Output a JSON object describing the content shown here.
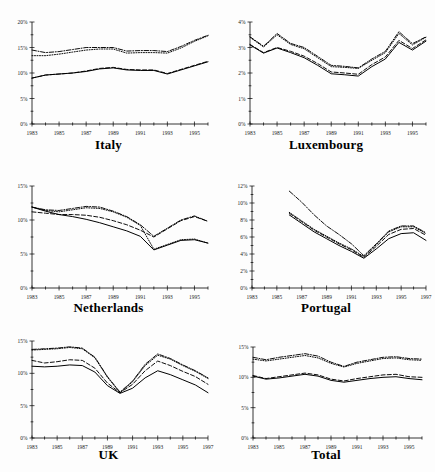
{
  "figure": {
    "layout": "2 columns x 3 rows of small-multiple line charts",
    "background_color": "#ffffff",
    "line_color": "#000000"
  },
  "chart_data": [
    {
      "type": "line",
      "title": "Italy",
      "xlabel": "",
      "ylabel": "",
      "grid": false,
      "legend_position": "none",
      "xlim": [
        1983,
        1996
      ],
      "ylim": [
        0,
        20
      ],
      "x": [
        1983,
        1984,
        1985,
        1986,
        1987,
        1988,
        1989,
        1990,
        1991,
        1992,
        1993,
        1994,
        1995,
        1996
      ],
      "xticklabels": [
        "1983",
        "1985",
        "1987",
        "1989",
        "1991",
        "1993",
        "1995"
      ],
      "xtickvalues": [
        1983,
        1985,
        1987,
        1989,
        1991,
        1993,
        1995
      ],
      "yticklabels": [
        "0%",
        "5%",
        "10%",
        "15%",
        "20%"
      ],
      "ytickvalues": [
        0,
        5,
        10,
        15,
        20
      ],
      "series": [
        {
          "name": "series-1",
          "style": "solid",
          "values": [
            9.0,
            9.6,
            9.8,
            10.0,
            10.3,
            10.8,
            11.0,
            10.6,
            10.5,
            10.5,
            9.8,
            10.6,
            11.4,
            12.2
          ]
        },
        {
          "name": "series-2",
          "style": "dashed",
          "values": [
            9.0,
            9.6,
            9.8,
            10.0,
            10.4,
            10.9,
            11.1,
            10.7,
            10.6,
            10.6,
            9.9,
            10.7,
            11.5,
            12.3
          ]
        },
        {
          "name": "series-3",
          "style": "dotted",
          "values": [
            13.4,
            13.4,
            13.7,
            14.1,
            14.5,
            14.7,
            14.7,
            13.9,
            14.0,
            14.0,
            13.9,
            14.9,
            16.2,
            17.3
          ]
        },
        {
          "name": "series-4",
          "style": "dashdot",
          "values": [
            14.5,
            14.0,
            14.2,
            14.6,
            15.0,
            15.0,
            15.0,
            14.3,
            14.4,
            14.4,
            14.2,
            15.2,
            16.4,
            17.4
          ]
        }
      ]
    },
    {
      "type": "line",
      "title": "Luxembourg",
      "xlabel": "",
      "ylabel": "",
      "grid": false,
      "legend_position": "none",
      "xlim": [
        1983,
        1996
      ],
      "ylim": [
        0,
        4
      ],
      "x": [
        1983,
        1984,
        1985,
        1986,
        1987,
        1988,
        1989,
        1990,
        1991,
        1992,
        1993,
        1994,
        1995,
        1996
      ],
      "xticklabels": [
        "1983",
        "1985",
        "1987",
        "1989",
        "1991",
        "1993",
        "1995"
      ],
      "xtickvalues": [
        1983,
        1985,
        1987,
        1989,
        1991,
        1993,
        1995
      ],
      "yticklabels": [
        "0%",
        "1%",
        "2%",
        "3%",
        "4%"
      ],
      "ytickvalues": [
        0,
        1,
        2,
        3,
        4
      ],
      "series": [
        {
          "name": "series-1",
          "style": "solid",
          "values": [
            3.1,
            2.78,
            2.98,
            2.8,
            2.6,
            2.3,
            1.97,
            1.93,
            1.88,
            2.25,
            2.55,
            3.2,
            2.9,
            3.25
          ]
        },
        {
          "name": "series-2",
          "style": "dashed",
          "values": [
            3.12,
            2.8,
            3.0,
            2.85,
            2.66,
            2.37,
            2.04,
            2.0,
            1.95,
            2.33,
            2.63,
            3.28,
            2.96,
            3.3
          ]
        },
        {
          "name": "series-3",
          "style": "dotted",
          "values": [
            3.4,
            3.02,
            3.5,
            3.12,
            2.95,
            2.6,
            2.25,
            2.22,
            2.18,
            2.5,
            2.8,
            3.55,
            3.1,
            3.4
          ]
        },
        {
          "name": "series-4",
          "style": "dashdot",
          "values": [
            3.42,
            3.05,
            3.55,
            3.16,
            3.0,
            2.65,
            2.3,
            2.26,
            2.2,
            2.55,
            2.85,
            3.62,
            3.15,
            3.42
          ]
        }
      ]
    },
    {
      "type": "line",
      "title": "Netherlands",
      "xlabel": "",
      "ylabel": "",
      "grid": false,
      "legend_position": "none",
      "xlim": [
        1983,
        1996
      ],
      "ylim": [
        0,
        15
      ],
      "x": [
        1983,
        1984,
        1985,
        1986,
        1987,
        1988,
        1989,
        1990,
        1991,
        1992,
        1993,
        1994,
        1995,
        1996
      ],
      "xticklabels": [
        "1983",
        "1985",
        "1987",
        "1989",
        "1991",
        "1993",
        "1995"
      ],
      "xtickvalues": [
        1983,
        1985,
        1987,
        1989,
        1991,
        1993,
        1995
      ],
      "yticklabels": [
        "0%",
        "5%",
        "10%",
        "15%"
      ],
      "ytickvalues": [
        0,
        5,
        10,
        15
      ],
      "series": [
        {
          "name": "series-1",
          "style": "solid",
          "values": [
            11.9,
            11.3,
            10.8,
            10.5,
            10.1,
            9.6,
            9.0,
            8.4,
            7.6,
            5.6,
            6.3,
            7.0,
            7.1,
            6.6
          ]
        },
        {
          "name": "series-2",
          "style": "dashed",
          "values": [
            11.2,
            11.0,
            10.8,
            10.8,
            10.7,
            10.4,
            9.9,
            9.3,
            8.5,
            7.5,
            8.7,
            9.9,
            10.5,
            9.8
          ]
        },
        {
          "name": "series-3",
          "style": "dotted",
          "values": [
            11.9,
            11.4,
            11.2,
            11.5,
            11.8,
            11.7,
            11.2,
            10.4,
            9.2,
            5.7,
            6.4,
            7.1,
            7.2,
            6.6
          ]
        },
        {
          "name": "series-4",
          "style": "dashdot",
          "values": [
            11.9,
            11.5,
            11.4,
            11.7,
            12.0,
            11.9,
            11.3,
            10.5,
            9.3,
            7.6,
            8.8,
            10.0,
            10.6,
            9.8
          ]
        }
      ]
    },
    {
      "type": "line",
      "title": "Portugal",
      "xlabel": "",
      "ylabel": "",
      "grid": false,
      "legend_position": "none",
      "xlim": [
        1983,
        1997
      ],
      "ylim": [
        0,
        12
      ],
      "x": [
        1986,
        1987,
        1988,
        1989,
        1990,
        1991,
        1992,
        1993,
        1994,
        1995,
        1996,
        1997
      ],
      "xticklabels": [
        "1983",
        "1985",
        "1987",
        "1989",
        "1991",
        "1993",
        "1995",
        "1997"
      ],
      "xtickvalues": [
        1983,
        1985,
        1987,
        1989,
        1991,
        1993,
        1995,
        1997
      ],
      "yticklabels": [
        "0%",
        "2%",
        "4%",
        "6%",
        "8%",
        "10%",
        "12%"
      ],
      "ytickvalues": [
        0,
        2,
        4,
        6,
        8,
        10,
        12
      ],
      "series": [
        {
          "name": "series-1",
          "style": "solid",
          "values": [
            8.6,
            7.6,
            6.6,
            5.8,
            5.0,
            4.3,
            3.5,
            4.6,
            5.8,
            6.4,
            6.5,
            5.6
          ]
        },
        {
          "name": "series-2",
          "style": "dashed",
          "values": [
            8.8,
            7.8,
            6.8,
            6.0,
            5.2,
            4.5,
            3.6,
            4.9,
            6.3,
            6.9,
            7.0,
            6.2
          ]
        },
        {
          "name": "series-3",
          "style": "dotted",
          "values": [
            8.9,
            7.9,
            6.9,
            6.1,
            5.3,
            4.6,
            3.7,
            5.1,
            6.6,
            7.2,
            7.2,
            6.4
          ]
        },
        {
          "name": "series-4",
          "style": "dashdot",
          "values": [
            11.4,
            10.1,
            8.6,
            7.3,
            6.3,
            5.2,
            3.8,
            5.2,
            6.7,
            7.3,
            7.3,
            6.5
          ]
        }
      ]
    },
    {
      "type": "line",
      "title": "UK",
      "xlabel": "",
      "ylabel": "",
      "grid": false,
      "legend_position": "none",
      "xlim": [
        1983,
        1997
      ],
      "ylim": [
        0,
        15
      ],
      "x": [
        1983,
        1984,
        1985,
        1986,
        1987,
        1988,
        1989,
        1990,
        1991,
        1992,
        1993,
        1994,
        1995,
        1996,
        1997
      ],
      "xticklabels": [
        "1983",
        "1985",
        "1987",
        "1989",
        "1991",
        "1993",
        "1995",
        "1997"
      ],
      "xtickvalues": [
        1983,
        1985,
        1987,
        1989,
        1991,
        1993,
        1995,
        1997
      ],
      "yticklabels": [
        "0%",
        "5%",
        "10%",
        "15%"
      ],
      "ytickvalues": [
        0,
        5,
        10,
        15
      ],
      "series": [
        {
          "name": "series-1",
          "style": "solid",
          "values": [
            11.1,
            11.0,
            11.1,
            11.3,
            11.2,
            10.2,
            8.1,
            6.9,
            7.7,
            9.3,
            10.4,
            9.8,
            9.0,
            8.2,
            7.0
          ]
        },
        {
          "name": "series-2",
          "style": "dashed",
          "values": [
            12.0,
            11.6,
            11.8,
            12.1,
            12.0,
            10.8,
            8.5,
            7.0,
            8.3,
            10.4,
            11.9,
            11.2,
            10.3,
            9.5,
            8.3
          ]
        },
        {
          "name": "series-3",
          "style": "dotted",
          "values": [
            13.6,
            13.7,
            13.8,
            14.0,
            13.8,
            12.4,
            9.4,
            7.0,
            8.7,
            11.2,
            12.8,
            12.2,
            11.2,
            10.3,
            9.2
          ]
        },
        {
          "name": "series-4",
          "style": "dashdot",
          "values": [
            13.7,
            13.8,
            13.9,
            14.1,
            13.9,
            12.5,
            9.5,
            7.1,
            8.8,
            11.4,
            13.0,
            12.3,
            11.3,
            10.4,
            9.3
          ]
        }
      ]
    },
    {
      "type": "line",
      "title": "Total",
      "xlabel": "",
      "ylabel": "",
      "grid": false,
      "legend_position": "none",
      "xlim": [
        1983,
        1996
      ],
      "ylim": [
        0,
        15
      ],
      "x": [
        1983,
        1984,
        1985,
        1986,
        1987,
        1988,
        1989,
        1990,
        1991,
        1992,
        1993,
        1994,
        1995,
        1996
      ],
      "xticklabels": [
        "1983",
        "1985",
        "1987",
        "1989",
        "1991",
        "1993",
        "1995"
      ],
      "xtickvalues": [
        1983,
        1985,
        1987,
        1989,
        1991,
        1993,
        1995
      ],
      "yticklabels": [
        "0%",
        "5%",
        "10%",
        "15%"
      ],
      "ytickvalues": [
        0,
        5,
        10,
        15
      ],
      "series": [
        {
          "name": "series-1",
          "style": "solid",
          "values": [
            10.2,
            9.7,
            9.9,
            10.2,
            10.5,
            10.2,
            9.5,
            9.2,
            9.5,
            9.8,
            10.0,
            10.1,
            9.8,
            9.6
          ]
        },
        {
          "name": "series-2",
          "style": "dashed",
          "values": [
            10.3,
            9.8,
            10.1,
            10.4,
            10.7,
            10.4,
            9.7,
            9.4,
            9.8,
            10.1,
            10.4,
            10.5,
            10.1,
            10.0
          ]
        },
        {
          "name": "series-3",
          "style": "dotted",
          "values": [
            13.0,
            12.7,
            13.0,
            13.3,
            13.6,
            13.2,
            12.3,
            11.7,
            12.3,
            12.7,
            13.1,
            13.2,
            12.9,
            12.8
          ]
        },
        {
          "name": "series-4",
          "style": "dashdot",
          "values": [
            13.3,
            12.9,
            13.3,
            13.6,
            13.9,
            13.5,
            12.5,
            11.8,
            12.5,
            12.9,
            13.3,
            13.4,
            13.1,
            13.0
          ]
        }
      ]
    }
  ]
}
